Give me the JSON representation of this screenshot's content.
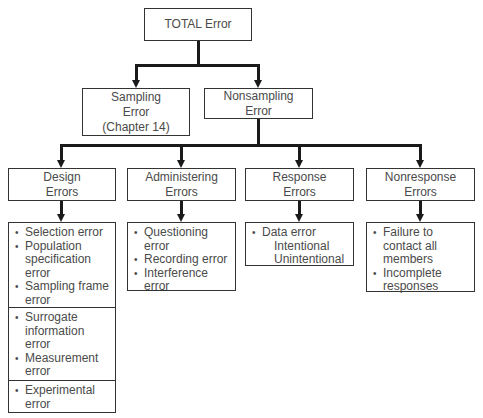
{
  "title": "TOTAL Error",
  "level1": [
    {
      "id": "sampling",
      "lines": [
        "Sampling",
        "Error",
        "(Chapter 14)"
      ]
    },
    {
      "id": "nonsampling",
      "lines": [
        "Nonsampling",
        "Error"
      ]
    }
  ],
  "level2": [
    {
      "id": "design",
      "lines": [
        "Design",
        "Errors"
      ]
    },
    {
      "id": "administering",
      "lines": [
        "Administering",
        "Errors"
      ]
    },
    {
      "id": "response",
      "lines": [
        "Response",
        "Errors"
      ]
    },
    {
      "id": "nonresponse",
      "lines": [
        "Nonresponse",
        "Errors"
      ]
    }
  ],
  "details": {
    "design": {
      "sections": [
        [
          {
            "text": "Selection error"
          },
          {
            "text": "Population specification error"
          },
          {
            "text": "Sampling frame error"
          }
        ],
        [
          {
            "text": "Surrogate information error"
          },
          {
            "text": "Measurement error"
          }
        ],
        [
          {
            "text": "Experimental error"
          }
        ]
      ]
    },
    "administering": {
      "items": [
        {
          "text": "Questioning error"
        },
        {
          "text": "Recording error"
        },
        {
          "text": "Interference error"
        }
      ]
    },
    "response": {
      "items": [
        {
          "text": "Data error"
        }
      ],
      "subitems": [
        "Intentional",
        "Unintentional"
      ]
    },
    "nonresponse": {
      "items": [
        {
          "text": "Failure to contact all members"
        },
        {
          "text": "Incomplete responses"
        }
      ]
    }
  },
  "colors": {
    "line": "#1a1a1a",
    "border": "#333333",
    "text": "#4a4a4a",
    "background": "#ffffff"
  }
}
